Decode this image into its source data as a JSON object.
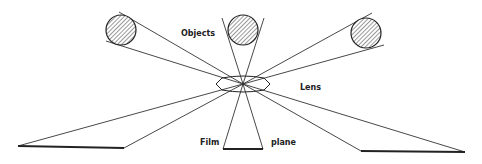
{
  "diagram": {
    "labels": {
      "objects": "Objects",
      "lens": "Lens",
      "film": "Film",
      "plane": "plane"
    },
    "colors": {
      "ink": "#222222",
      "background": "#ffffff"
    },
    "objects": [
      {
        "name": "left-object",
        "cx": 121,
        "cy": 30,
        "r": 15
      },
      {
        "name": "middle-object",
        "cx": 243,
        "cy": 30,
        "r": 15
      },
      {
        "name": "right-object",
        "cx": 366,
        "cy": 33,
        "r": 15
      }
    ],
    "lens": {
      "cx": 243,
      "cy": 84,
      "rx": 27,
      "ry": 7
    },
    "film_images": [
      {
        "name": "left-image",
        "x1": 18,
        "y1": 146,
        "x2": 124,
        "y2": 148
      },
      {
        "name": "middle-image",
        "x1": 223,
        "y1": 149,
        "x2": 263,
        "y2": 149
      },
      {
        "name": "right-image",
        "x1": 361,
        "y1": 151,
        "x2": 465,
        "y2": 152
      }
    ]
  }
}
